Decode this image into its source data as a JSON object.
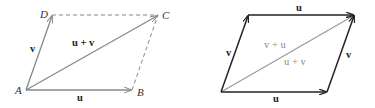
{
  "figure": {
    "left_panel": {
      "title": "Parallelogram law (labeled vertices)",
      "points": {
        "A": {
          "label": "A",
          "x": 26,
          "y": 90
        },
        "B": {
          "label": "B",
          "x": 132,
          "y": 90
        },
        "C": {
          "label": "C",
          "x": 158,
          "y": 15
        },
        "D": {
          "label": "D",
          "x": 52,
          "y": 15
        }
      },
      "vectors": [
        {
          "name": "u",
          "from": "A",
          "to": "B",
          "label": "u",
          "style": "solid-arrow"
        },
        {
          "name": "v",
          "from": "A",
          "to": "D",
          "label": "v",
          "style": "solid-arrow"
        },
        {
          "name": "u+v",
          "from": "A",
          "to": "C",
          "label": "u + v",
          "style": "solid-arrow"
        }
      ],
      "dashed_edges": [
        {
          "from": "D",
          "to": "C"
        },
        {
          "from": "B",
          "to": "C"
        }
      ],
      "stroke_color": "#888888",
      "dash_color": "#888888"
    },
    "right_panel": {
      "title": "Commutativity u + v = v + u",
      "vectors": [
        {
          "name": "u-bottom",
          "label": "u",
          "style": "solid-arrow"
        },
        {
          "name": "v-left",
          "label": "v",
          "style": "solid-arrow"
        },
        {
          "name": "u-top",
          "label": "u",
          "style": "solid-arrow"
        },
        {
          "name": "v-right",
          "label": "v",
          "style": "solid-arrow"
        },
        {
          "name": "diagonal",
          "label_upper": "v + u",
          "label_lower": "u + v",
          "style": "solid-arrow"
        }
      ],
      "edge_color": "#222222",
      "diagonal_color": "#999999"
    }
  }
}
